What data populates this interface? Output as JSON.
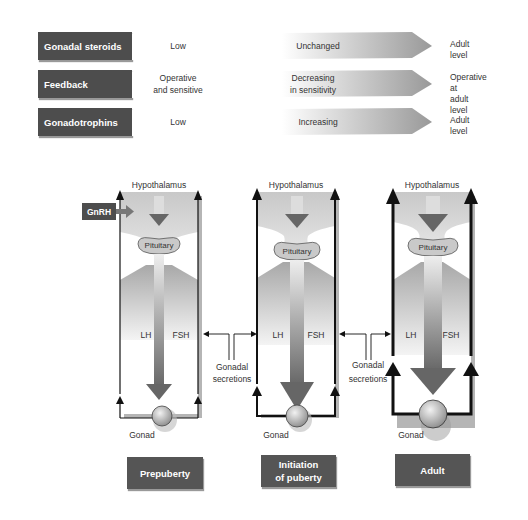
{
  "summary_table": {
    "rows": [
      {
        "label": "Gonadal steroids",
        "prepuberty": "Low",
        "transition": "Unchanged",
        "adult_line1": "Adult level",
        "adult_line2": ""
      },
      {
        "label": "Feedback",
        "prepuberty_line1": "Operative",
        "prepuberty_line2": "and sensitive",
        "transition_line1": "Decreasing",
        "transition_line2": "in sensitivity",
        "adult_line1": "Operative at",
        "adult_line2": "adult level"
      },
      {
        "label": "Gonadotrophins",
        "prepuberty": "Low",
        "transition": "Increasing",
        "adult_line1": "Adult level",
        "adult_line2": ""
      }
    ]
  },
  "diagram": {
    "gnrh_label": "GnRH",
    "hypothalamus_label": "Hypothalamus",
    "pituitary_label": "Pituitary",
    "lh_label": "LH",
    "fsh_label": "FSH",
    "gonad_label": "Gonad",
    "secretions_line1": "Gonadal",
    "secretions_line2": "secretions",
    "stages": [
      {
        "line1": "Prepuberty",
        "line2": ""
      },
      {
        "line1": "Initiation",
        "line2": "of puberty"
      },
      {
        "line1": "Adult",
        "line2": ""
      }
    ]
  },
  "colors": {
    "label_box": "#4d4d4d",
    "stage_box": "#555555",
    "line": "#111111"
  }
}
